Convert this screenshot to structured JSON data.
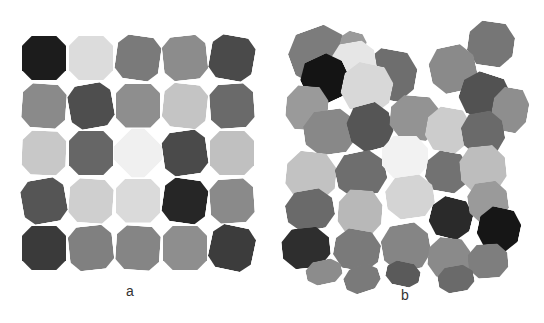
{
  "figure": {
    "panels": [
      {
        "label": "a",
        "description": "5x5 ordered grid of cube-shaped particles",
        "grid_rows": 5,
        "grid_cols": 5,
        "cells": [
          [
            "#1c1c1c",
            "#dcdcdc",
            "#7a7a7a",
            "#8c8c8c",
            "#4a4a4a"
          ],
          [
            "#8a8a8a",
            "#4e4e4e",
            "#8e8e8e",
            "#c4c4c4",
            "#6a6a6a"
          ],
          [
            "#c8c8c8",
            "#666666",
            "#f0f0f0",
            "#4a4a4a",
            "#c0c0c0"
          ],
          [
            "#555555",
            "#cfcfcf",
            "#dadada",
            "#262626",
            "#8a8a8a"
          ],
          [
            "#3a3a3a",
            "#808080",
            "#858585",
            "#8e8e8e",
            "#3c3c3c"
          ]
        ]
      },
      {
        "label": "b",
        "description": "disordered cluster of cube-shaped particles"
      }
    ]
  }
}
